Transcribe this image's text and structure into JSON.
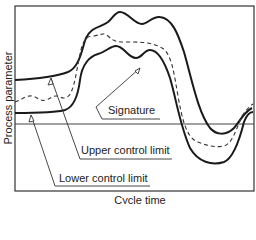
{
  "figure": {
    "type": "process control chart diagram",
    "axes": {
      "x_label": "Cycle time",
      "y_label": "Process parameter"
    },
    "callouts": {
      "signature": "Signature",
      "upper_limit": "Upper control limit",
      "lower_limit": "Lower control limit"
    },
    "curves": [
      {
        "name": "Upper control limit",
        "style": "solid"
      },
      {
        "name": "Signature",
        "style": "dashed"
      },
      {
        "name": "Lower control limit",
        "style": "solid"
      }
    ],
    "reference_line": "horizontal baseline",
    "colors": {
      "line": "#1a1a1a",
      "frame": "#333333",
      "background": "#ffffff"
    }
  }
}
